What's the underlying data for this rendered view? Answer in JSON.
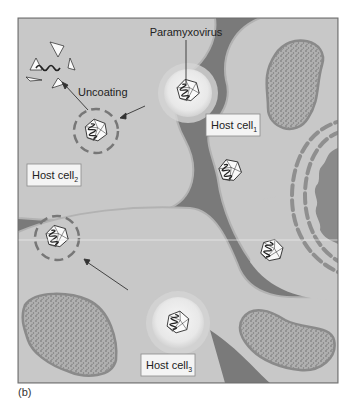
{
  "figure": {
    "panel_label": "(b)",
    "labels": {
      "virus": "Paramyxovirus",
      "uncoating": "Uncoating",
      "host_cell_1": "Host cell",
      "host_cell_1_sub": "1",
      "host_cell_2": "Host cell",
      "host_cell_2_sub": "2",
      "host_cell_3": "Host cell",
      "host_cell_3_sub": "3"
    },
    "colors": {
      "background_gap": "#7a7a7a",
      "cell_body": "#c9c9c9",
      "cell_edge": "#b4b4b4",
      "vesicle": "#eeeeee",
      "organelle_fill": "#a3a3a3",
      "organelle_border": "#8a8a8a",
      "nucleus": "#8c8c8c",
      "envelope_dash": "#8f8f8f",
      "label_box": "#f4f4f4",
      "frame": "#6a6a6a"
    }
  }
}
